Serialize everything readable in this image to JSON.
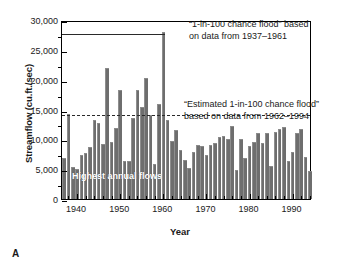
{
  "panel_letter": "A",
  "chart_data": {
    "type": "bar",
    "title": "",
    "xlabel": "Year",
    "ylabel": "Streamflow (cu.ft./sec)",
    "ylim": [
      0,
      30000
    ],
    "xlim": [
      1936.5,
      1994.5
    ],
    "grid": false,
    "legend": null,
    "ytick_labels": [
      "0",
      "5,000",
      "10,000",
      "15,000",
      "20,000",
      "25,000",
      "30,000"
    ],
    "ytick_values": [
      0,
      5000,
      10000,
      15000,
      20000,
      25000,
      30000
    ],
    "xtick_labels": [
      "1940",
      "1950",
      "1960",
      "1970",
      "1980",
      "1990"
    ],
    "xtick_values": [
      1940,
      1950,
      1960,
      1970,
      1980,
      1990
    ],
    "bar_color": "#6e6e6e",
    "series_name": "Highest annual flows",
    "categories": [
      1937,
      1938,
      1939,
      1940,
      1941,
      1942,
      1943,
      1944,
      1945,
      1946,
      1947,
      1948,
      1949,
      1950,
      1951,
      1952,
      1953,
      1954,
      1955,
      1956,
      1957,
      1958,
      1959,
      1960,
      1961,
      1962,
      1963,
      1964,
      1965,
      1966,
      1967,
      1968,
      1969,
      1970,
      1971,
      1972,
      1973,
      1974,
      1975,
      1976,
      1977,
      1978,
      1979,
      1980,
      1981,
      1982,
      1983,
      1984,
      1985,
      1986,
      1987,
      1988,
      1989,
      1990,
      1991,
      1992,
      1993,
      1994
    ],
    "values": [
      6800,
      14300,
      5400,
      4950,
      7300,
      7700,
      8700,
      13300,
      12800,
      9200,
      21900,
      9600,
      11900,
      18300,
      6400,
      6400,
      13500,
      18200,
      15500,
      20200,
      14000,
      5950,
      15900,
      28000,
      13200,
      9700,
      11600,
      8200,
      6500,
      5200,
      7800,
      9100,
      8900,
      7300,
      9000,
      9400,
      10400,
      10600,
      10000,
      12300,
      4850,
      10100,
      6800,
      8900,
      9600,
      11000,
      9400,
      11100,
      5500,
      11200,
      11800,
      12000,
      6350,
      7900,
      11100,
      11800,
      7000,
      4700
    ],
    "annotations": [
      {
        "id": "threshold-1937-1961",
        "style": "solid",
        "value": 28000,
        "text_line1": "“1-in-100 chance flood” based",
        "text_line2": "on data from 1937–1961"
      },
      {
        "id": "threshold-1962-1994",
        "style": "dashed",
        "value": 14400,
        "text_line1": "“Estimated 1-in-100 chance flood”",
        "text_line2": "based on data from 1962–1994"
      },
      {
        "id": "series-label",
        "style": "inplot",
        "text_line1": "Highest annual flows"
      }
    ]
  }
}
